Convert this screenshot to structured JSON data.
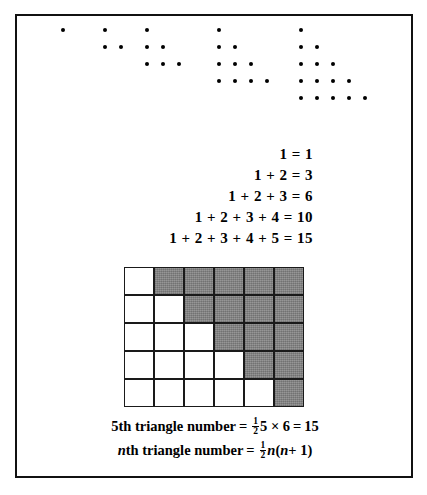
{
  "figure": {
    "border_color": "#111111",
    "background": "#ffffff"
  },
  "dot_patterns": {
    "description": "Five triangular dot arrays of 1, 3, 6, 10 and 15 dots",
    "groups": [
      {
        "name": "triangle-1",
        "rows": 1,
        "total_dots": 1,
        "left": 44
      },
      {
        "name": "triangle-2",
        "rows": 2,
        "total_dots": 3,
        "left": 86
      },
      {
        "name": "triangle-3",
        "rows": 3,
        "total_dots": 6,
        "left": 128
      },
      {
        "name": "triangle-4",
        "rows": 4,
        "total_dots": 10,
        "left": 200
      },
      {
        "name": "triangle-5",
        "rows": 5,
        "total_dots": 15,
        "left": 282
      }
    ],
    "dot_color": "#000000",
    "dot_spacing_x": 16,
    "dot_spacing_y": 17,
    "dot_start_y": 12
  },
  "equations": {
    "lines": [
      "1 = 1",
      "1 + 2 = 3",
      "1 + 2 + 3 = 6",
      "1 + 2 + 3 + 4 = 10",
      "1 + 2 + 3 + 4 + 5 = 15"
    ]
  },
  "grid": {
    "columns": 6,
    "rows": 5,
    "shaded_color": "#8a8a8a",
    "empty_color": "#ffffff",
    "line_color": "#1a1a1a",
    "cells": [
      [
        "empty",
        "shaded",
        "shaded",
        "shaded",
        "shaded",
        "shaded"
      ],
      [
        "empty",
        "empty",
        "shaded",
        "shaded",
        "shaded",
        "shaded"
      ],
      [
        "empty",
        "empty",
        "empty",
        "shaded",
        "shaded",
        "shaded"
      ],
      [
        "empty",
        "empty",
        "empty",
        "empty",
        "shaded",
        "shaded"
      ],
      [
        "empty",
        "empty",
        "empty",
        "empty",
        "empty",
        "shaded"
      ]
    ]
  },
  "formulas": {
    "line1": {
      "label": "5th triangle number",
      "equals": "=",
      "frac_num": "1",
      "frac_den": "2",
      "expr": "5 × 6",
      "equals2": "=",
      "result": "15"
    },
    "line2": {
      "label_italic": "n",
      "label_rest": "th triangle number",
      "equals": "=",
      "frac_num": "1",
      "frac_den": "2",
      "expr_n1": "n",
      "expr_open": "(",
      "expr_n2": "n",
      "expr_plus": "+ 1",
      "expr_close": ")"
    }
  }
}
